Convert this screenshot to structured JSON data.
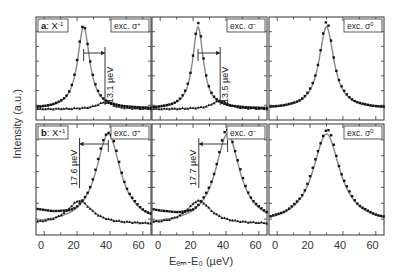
{
  "chart_data": {
    "type": "line",
    "title": "",
    "xlabel": "E_em-E_0 (µeV)",
    "ylabel": "Intensity (a.u.)",
    "xlim": [
      -5,
      65
    ],
    "xticks": [
      0,
      20,
      40,
      60
    ],
    "rows": [
      {
        "label": "a",
        "species": "X^-1",
        "panels": [
          {
            "excitation": "exc. σ+",
            "main_peak": 24,
            "side_peak": 37,
            "main_width": 9,
            "side_width": 12,
            "side_amp": 0.08,
            "annotation": "13.1 µeV",
            "arrow_from": 24,
            "arrow_to": 37
          },
          {
            "excitation": "exc. σ−",
            "main_peak": 23,
            "side_peak": 36.5,
            "main_width": 8,
            "side_width": 12,
            "side_amp": 0.1,
            "annotation": "13.5 µeV",
            "arrow_from": 23,
            "arrow_to": 36.5
          },
          {
            "excitation": "exc. σ0",
            "main_peak": 30,
            "side_peak": null,
            "main_width": 11,
            "side_width": 0,
            "side_amp": 0,
            "annotation": "",
            "arrow_from": null,
            "arrow_to": null
          }
        ]
      },
      {
        "label": "b",
        "species": "X^+1",
        "panels": [
          {
            "excitation": "exc. σ+",
            "main_peak": 39,
            "side_peak": 21.5,
            "main_width": 18,
            "side_width": 18,
            "side_amp": 0.25,
            "annotation": "17.6 µeV",
            "arrow_from": 39,
            "arrow_to": 21.5
          },
          {
            "excitation": "exc. σ−",
            "main_peak": 41,
            "side_peak": 23.5,
            "main_width": 18,
            "side_width": 18,
            "side_amp": 0.25,
            "annotation": "17.7 µeV",
            "arrow_from": 41,
            "arrow_to": 23.5
          },
          {
            "excitation": "exc. σ0",
            "main_peak": 30,
            "side_peak": null,
            "main_width": 20,
            "side_width": 0,
            "side_amp": 0,
            "annotation": "",
            "arrow_from": null,
            "arrow_to": null
          }
        ]
      }
    ],
    "grid": false,
    "legend": "none"
  },
  "labels": {
    "ylabel": "Intensity (a.u.)",
    "xlabel": "Eₑₘ-E₀ (µeV)",
    "row_a": "a",
    "row_a_species": ": X",
    "row_a_sup": "-1",
    "row_b": "b",
    "row_b_species": ": X",
    "row_b_sup": "+1",
    "exc_plus": "exc. σ",
    "exc_plus_sup": "+",
    "exc_minus": "exc. σ",
    "exc_minus_sup": "−",
    "exc_zero": "exc. σ",
    "exc_zero_sup": "0",
    "ann_a1": "13.1 µeV",
    "ann_a2": "13.5 µeV",
    "ann_b1": "17.6 µeV",
    "ann_b2": "17.7 µeV",
    "tick0": "0",
    "tick20": "20",
    "tick40": "40",
    "tick60": "60"
  }
}
